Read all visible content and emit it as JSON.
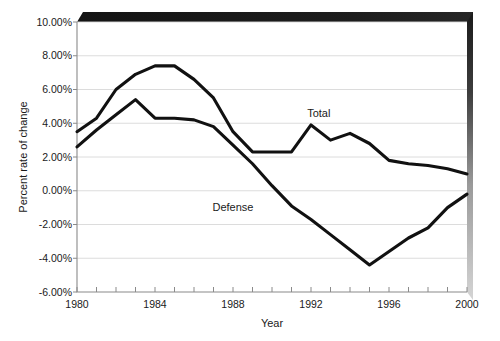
{
  "chart_data": {
    "type": "line",
    "title": "",
    "xlabel": "Year",
    "ylabel": "Percent rate of change",
    "xlim": [
      1980,
      2000
    ],
    "ylim": [
      -6,
      10
    ],
    "grid": true,
    "legend_position": "inline-annotations",
    "x": [
      1980,
      1981,
      1982,
      1983,
      1984,
      1985,
      1986,
      1987,
      1988,
      1989,
      1990,
      1991,
      1992,
      1993,
      1994,
      1995,
      1996,
      1997,
      1998,
      1999,
      2000
    ],
    "y_ticks": [
      "-6.00%",
      "-4.00%",
      "-2.00%",
      "0.00%",
      "2.00%",
      "4.00%",
      "6.00%",
      "8.00%",
      "10.00%"
    ],
    "y_tick_values": [
      -6,
      -4,
      -2,
      0,
      2,
      4,
      6,
      8,
      10
    ],
    "x_ticks": [
      "1980",
      "1984",
      "1988",
      "1992",
      "1996",
      "2000"
    ],
    "x_tick_values": [
      1980,
      1984,
      1988,
      1992,
      1996,
      2000
    ],
    "series": [
      {
        "name": "Total",
        "label": "Total",
        "color": "#111111",
        "values": [
          3.5,
          4.3,
          6.0,
          6.9,
          7.4,
          7.4,
          6.6,
          5.5,
          3.5,
          2.3,
          2.3,
          2.3,
          3.9,
          3.0,
          3.4,
          2.8,
          1.8,
          1.6,
          1.5,
          1.3,
          1.0
        ]
      },
      {
        "name": "Defense",
        "label": "Defense",
        "color": "#111111",
        "values": [
          2.6,
          3.6,
          4.5,
          5.4,
          4.3,
          4.3,
          4.2,
          3.8,
          2.7,
          1.6,
          0.3,
          -0.9,
          -1.7,
          -2.6,
          -3.5,
          -4.4,
          -3.6,
          -2.8,
          -2.2,
          -1.0,
          -0.2
        ]
      }
    ],
    "annotations": [
      {
        "text": "Total",
        "x": 1992.4,
        "y": 4.4
      },
      {
        "text": "Defense",
        "x": 1988.0,
        "y": -1.2
      }
    ]
  },
  "decor": {
    "top_band_color": "#1a1a1a",
    "right_shadow_top_color": "#1a1a1a",
    "right_shadow_bottom_color": "#d0d0d0",
    "grid_color": "#d8d8d8",
    "axis_color": "#8a8a8a"
  }
}
